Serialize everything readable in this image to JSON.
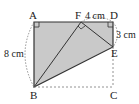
{
  "diagram": {
    "points": {
      "A": {
        "label": "A",
        "x": 34,
        "y": 22
      },
      "F": {
        "label": "F",
        "x": 81,
        "y": 22
      },
      "D": {
        "label": "D",
        "x": 113,
        "y": 22
      },
      "E": {
        "label": "E",
        "x": 113,
        "y": 47
      },
      "B": {
        "label": "B",
        "x": 34,
        "y": 87
      },
      "C": {
        "label": "C",
        "x": 113,
        "y": 87
      }
    },
    "dimensions": {
      "AB": "8 cm",
      "FD": "4 cm",
      "DE": "3 cm"
    },
    "colors": {
      "fill": "#c9c9c9",
      "stroke": "#333333",
      "dashed": "#777777"
    }
  }
}
